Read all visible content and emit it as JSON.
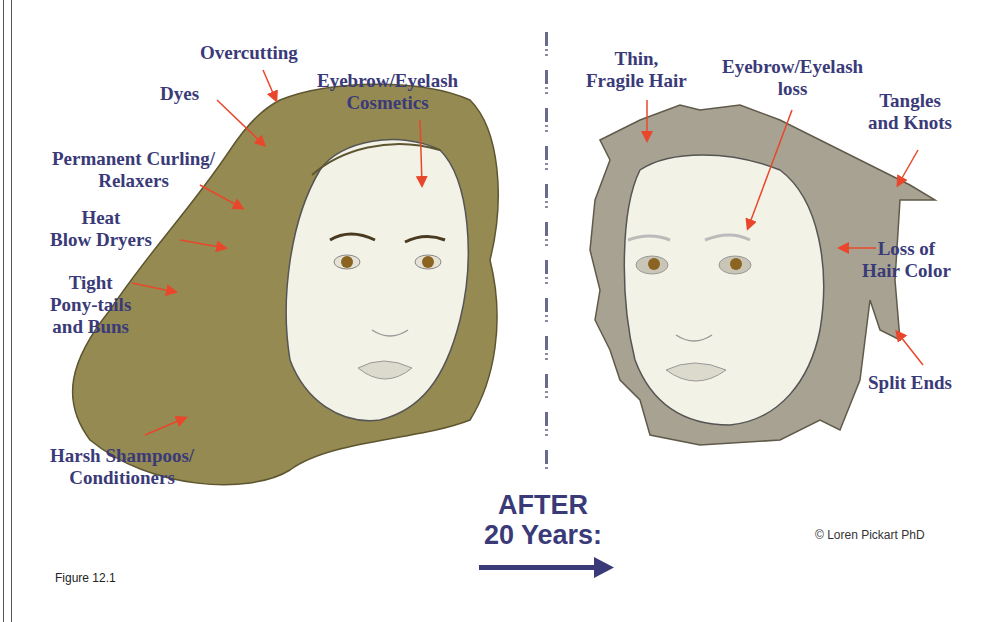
{
  "figure": {
    "caption": "Figure 12.1",
    "copyright": "© Loren Pickart PhD",
    "transition": {
      "line1": "AFTER",
      "line2": "20 Years:",
      "arrow": "right-arrow-icon"
    },
    "colors": {
      "label_text": "#3a3a78",
      "arrow": "#e8472c",
      "young_hair": "#948a52",
      "aged_hair": "#a8a292",
      "skin": "#f3f2e6"
    }
  },
  "before_panel": {
    "labels": [
      {
        "id": "overcutting",
        "lines": [
          "Overcutting"
        ]
      },
      {
        "id": "dyes",
        "lines": [
          "Dyes"
        ]
      },
      {
        "id": "eyebrow-cosmetics",
        "lines": [
          "Eyebrow/Eyelash",
          "Cosmetics"
        ]
      },
      {
        "id": "perm",
        "lines": [
          "Permanent Curling/",
          "Relaxers"
        ]
      },
      {
        "id": "heat",
        "lines": [
          "Heat",
          "Blow Dryers"
        ]
      },
      {
        "id": "tight",
        "lines": [
          "Tight",
          "Pony-tails",
          "and Buns"
        ]
      },
      {
        "id": "harsh",
        "lines": [
          "Harsh Shampoos/",
          "Conditioners"
        ]
      }
    ]
  },
  "after_panel": {
    "labels": [
      {
        "id": "thin",
        "lines": [
          "Thin,",
          "Fragile Hair"
        ]
      },
      {
        "id": "eyebrow-loss",
        "lines": [
          "Eyebrow/Eyelash",
          "loss"
        ]
      },
      {
        "id": "tangles",
        "lines": [
          "Tangles",
          "and Knots"
        ]
      },
      {
        "id": "color-loss",
        "lines": [
          "Loss of",
          "Hair Color"
        ]
      },
      {
        "id": "split",
        "lines": [
          "Split Ends"
        ]
      }
    ]
  }
}
